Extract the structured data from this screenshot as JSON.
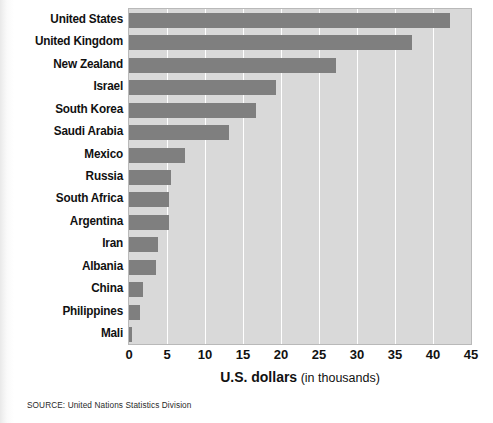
{
  "chart_data": {
    "type": "bar",
    "orientation": "horizontal",
    "title": "",
    "subtitle": "",
    "xlabel_strong": "U.S. dollars",
    "xlabel_weak": "(in thousands)",
    "ylabel": "",
    "xlim": [
      0,
      45
    ],
    "xticks": [
      0,
      5,
      10,
      15,
      20,
      25,
      30,
      35,
      40,
      45
    ],
    "grid": "vertical-white-gridlines",
    "legend": "none",
    "categories": [
      "United States",
      "United Kingdom",
      "New Zealand",
      "Israel",
      "South Korea",
      "Saudi Arabia",
      "Mexico",
      "Russia",
      "South Africa",
      "Argentina",
      "Iran",
      "Albania",
      "China",
      "Philippines",
      "Mali"
    ],
    "values": [
      42.2,
      37.3,
      27.2,
      19.4,
      16.7,
      13.1,
      7.4,
      5.5,
      5.3,
      5.2,
      3.8,
      3.5,
      1.9,
      1.5,
      0.4
    ],
    "series": [
      {
        "name": "U.S. dollars (in thousands)",
        "values": [
          42.2,
          37.3,
          27.2,
          19.4,
          16.7,
          13.1,
          7.4,
          5.5,
          5.3,
          5.2,
          3.8,
          3.5,
          1.9,
          1.5,
          0.4
        ]
      }
    ],
    "bar_color": "#7f7f7f",
    "plot_background": "#d9d9d9",
    "gridline_color": "#ffffff",
    "annotations": []
  },
  "source": {
    "note": "SOURCE: United Nations Statistics Division"
  }
}
